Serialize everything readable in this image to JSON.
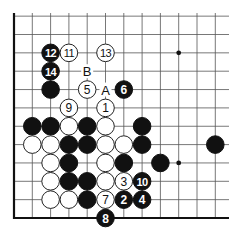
{
  "diagram": {
    "type": "go-board-diagram",
    "visible_columns": 12,
    "visible_rows": 12,
    "edges": [
      "left",
      "bottom"
    ],
    "grid": {
      "origin_x": 14,
      "bottom_y": 218,
      "spacing_x": 18.3,
      "spacing_y": 18.35,
      "right_x": 229,
      "top_y": 13
    },
    "colors": {
      "black": "#111111",
      "white": "#ffffff",
      "line": "#555555",
      "edge": "#111111"
    },
    "star_points": [
      {
        "c": 9,
        "r": 9
      },
      {
        "c": 9,
        "r": 3
      }
    ],
    "stones": [
      {
        "c": 1,
        "r": 5,
        "color": "black",
        "label": ""
      },
      {
        "c": 2,
        "r": 5,
        "color": "black",
        "label": ""
      },
      {
        "c": 3,
        "r": 5,
        "color": "white",
        "label": ""
      },
      {
        "c": 4,
        "r": 5,
        "color": "black",
        "label": ""
      },
      {
        "c": 5,
        "r": 5,
        "color": "white",
        "label": ""
      },
      {
        "c": 7,
        "r": 5,
        "color": "black",
        "label": ""
      },
      {
        "c": 1,
        "r": 4,
        "color": "white",
        "label": ""
      },
      {
        "c": 2,
        "r": 4,
        "color": "white",
        "label": ""
      },
      {
        "c": 3,
        "r": 4,
        "color": "black",
        "label": ""
      },
      {
        "c": 4,
        "r": 4,
        "color": "black",
        "label": ""
      },
      {
        "c": 5,
        "r": 4,
        "color": "white",
        "label": ""
      },
      {
        "c": 6,
        "r": 4,
        "color": "white",
        "label": ""
      },
      {
        "c": 7,
        "r": 4,
        "color": "black",
        "label": ""
      },
      {
        "c": 11,
        "r": 4,
        "color": "black",
        "label": ""
      },
      {
        "c": 2,
        "r": 3,
        "color": "white",
        "label": ""
      },
      {
        "c": 3,
        "r": 3,
        "color": "black",
        "label": ""
      },
      {
        "c": 5,
        "r": 3,
        "color": "white",
        "label": ""
      },
      {
        "c": 6,
        "r": 3,
        "color": "black",
        "label": ""
      },
      {
        "c": 8,
        "r": 3,
        "color": "black",
        "label": ""
      },
      {
        "c": 2,
        "r": 2,
        "color": "white",
        "label": ""
      },
      {
        "c": 3,
        "r": 2,
        "color": "black",
        "label": ""
      },
      {
        "c": 4,
        "r": 2,
        "color": "black",
        "label": ""
      },
      {
        "c": 5,
        "r": 2,
        "color": "white",
        "label": ""
      },
      {
        "c": 2,
        "r": 1,
        "color": "white",
        "label": ""
      },
      {
        "c": 3,
        "r": 1,
        "color": "white",
        "label": ""
      },
      {
        "c": 4,
        "r": 1,
        "color": "black",
        "label": ""
      },
      {
        "c": 2,
        "r": 7,
        "color": "black",
        "label": ""
      },
      {
        "c": 5,
        "r": 6,
        "color": "white",
        "label": "1"
      },
      {
        "c": 6,
        "r": 1,
        "color": "black",
        "label": "2"
      },
      {
        "c": 6,
        "r": 2,
        "color": "white",
        "label": "3"
      },
      {
        "c": 7,
        "r": 1,
        "color": "black",
        "label": "4"
      },
      {
        "c": 4,
        "r": 7,
        "color": "white",
        "label": "5"
      },
      {
        "c": 6,
        "r": 7,
        "color": "black",
        "label": "6"
      },
      {
        "c": 5,
        "r": 1,
        "color": "white",
        "label": "7"
      },
      {
        "c": 5,
        "r": 0,
        "color": "black",
        "label": "8"
      },
      {
        "c": 3,
        "r": 6,
        "color": "white",
        "label": "9"
      },
      {
        "c": 7,
        "r": 2,
        "color": "black",
        "label": "10"
      },
      {
        "c": 3,
        "r": 9,
        "color": "white",
        "label": "11"
      },
      {
        "c": 2,
        "r": 9,
        "color": "black",
        "label": "12"
      },
      {
        "c": 5,
        "r": 9,
        "color": "white",
        "label": "13"
      },
      {
        "c": 2,
        "r": 8,
        "color": "black",
        "label": "14"
      }
    ],
    "marks": [
      {
        "c": 5,
        "r": 7,
        "label": "A"
      },
      {
        "c": 4,
        "r": 8,
        "label": "B"
      }
    ]
  }
}
